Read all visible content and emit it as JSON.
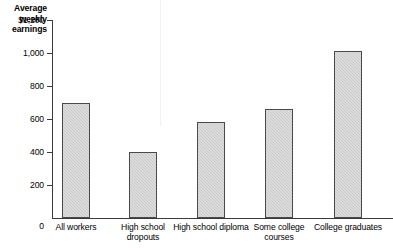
{
  "chart_data": {
    "type": "bar",
    "title": "Average weekly earnings",
    "xlabel": "",
    "ylabel": "Average weekly earnings",
    "categories": [
      "All workers",
      "High school dropouts",
      "High school diploma",
      "Some college courses",
      "College graduates"
    ],
    "values": [
      700,
      400,
      580,
      660,
      1010
    ],
    "ylim": [
      0,
      1200
    ],
    "yticks": [
      0,
      200,
      400,
      600,
      800,
      1000,
      1200
    ],
    "ytick_labels": [
      "0",
      "200",
      "400",
      "600",
      "800",
      "1,000",
      "$1,200"
    ],
    "grid": false,
    "legend": false,
    "bar_color": "#c9c9c9",
    "bar_border_color": "#4a4a4a",
    "axis_color": "#3a3a3a"
  },
  "axis_title": {
    "line1": "Average",
    "line2": "weekly",
    "line3": "earnings"
  }
}
